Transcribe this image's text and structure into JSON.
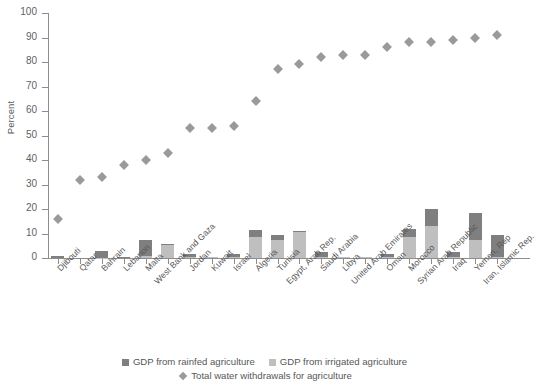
{
  "chart_data": {
    "type": "bar",
    "title": "",
    "xlabel": "",
    "ylabel": "Percent",
    "ylim": [
      0,
      100
    ],
    "ytick_step": 10,
    "yticks": [
      0,
      10,
      20,
      30,
      40,
      50,
      60,
      70,
      80,
      90,
      100
    ],
    "grid": false,
    "legend_position": "bottom-center",
    "stacked": true,
    "categories": [
      "Djibouti",
      "Qatar",
      "Bahrain",
      "Lebanon",
      "Malta",
      "West Bank and Gaza",
      "Jordan",
      "Kuwait",
      "Israel",
      "Algeria",
      "Tunisia",
      "Egypt, Arab Rep.",
      "Saudi Arabia",
      "Libya",
      "United Arab Emirates",
      "Oman",
      "Morocco",
      "Syrian Arab Republic",
      "Iraq",
      "Yemen, Rep",
      "Iran, Islamic Rep."
    ],
    "series": [
      {
        "name": "GDP from rainfed agriculture",
        "color": "#7f7f7f",
        "values": [
          1.0,
          0.0,
          2.8,
          0.5,
          6.5,
          0.3,
          1.0,
          0.0,
          1.2,
          3.0,
          2.0,
          0.5,
          1.8,
          0.2,
          0.3,
          1.4,
          3.5,
          7.0,
          2.0,
          11.0,
          9.0
        ]
      },
      {
        "name": "GDP from irrigated agriculture",
        "color": "#bfbfbf",
        "values": [
          0.0,
          0.0,
          0.2,
          0.0,
          0.8,
          5.5,
          0.5,
          0.3,
          0.5,
          8.5,
          7.5,
          10.5,
          0.6,
          0.2,
          0.3,
          0.3,
          8.5,
          13.0,
          0.5,
          7.5,
          0.3
        ]
      }
    ],
    "marker_series": {
      "name": "Total water withdrawals for agriculture",
      "color": "#9a9a9a",
      "marker": "diamond",
      "values": [
        16,
        32,
        33,
        38,
        40,
        43,
        53,
        53,
        54,
        64,
        77,
        79,
        82,
        83,
        83,
        86,
        88,
        88,
        89,
        90,
        91
      ]
    }
  },
  "legend": {
    "items": [
      {
        "label": "GDP from rainfed agriculture",
        "swatch": "dark-square-swatch"
      },
      {
        "label": "GDP from irrigated agriculture",
        "swatch": "light-square-swatch"
      },
      {
        "label": "Total water withdrawals for agriculture",
        "swatch": "diamond-marker-swatch"
      }
    ]
  }
}
